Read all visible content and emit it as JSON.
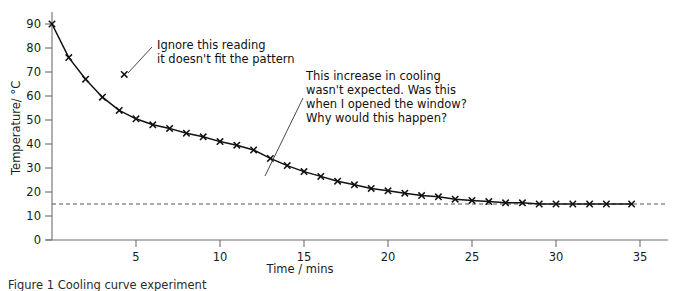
{
  "figure": {
    "caption": "Figure 1  Cooling curve experiment"
  },
  "chart_data": {
    "type": "line",
    "title": "",
    "xlabel": "Time / mins",
    "ylabel": "Temperature/ °C",
    "xlim": [
      0,
      37
    ],
    "ylim": [
      0,
      95
    ],
    "grid": false,
    "legend": "none",
    "x_ticks": [
      5,
      10,
      15,
      20,
      25,
      30,
      35
    ],
    "y_ticks": [
      0,
      10,
      20,
      30,
      40,
      50,
      60,
      70,
      80,
      90
    ],
    "x_tick_labels": [
      "5",
      "10",
      "15",
      "20",
      "25",
      "30",
      "35"
    ],
    "y_tick_labels": [
      "0",
      "10",
      "20",
      "30",
      "40",
      "50",
      "60",
      "70",
      "80",
      "90"
    ],
    "reference_line": {
      "label": "room temperature",
      "orientation": "horizontal",
      "value": 15,
      "style": "dashed"
    },
    "series": [
      {
        "name": "Temperature of cooling liquid",
        "marker": "x",
        "x": [
          0,
          1,
          2,
          3,
          4,
          5,
          6,
          7,
          8,
          9,
          10,
          11,
          12,
          13,
          14,
          15,
          16,
          17,
          18,
          19,
          20,
          21,
          22,
          23,
          24,
          25,
          26,
          27,
          28,
          29,
          30,
          31,
          32,
          33,
          34.5
        ],
        "values": [
          90,
          76,
          67,
          59.5,
          54,
          50.5,
          48,
          46.5,
          44.5,
          43,
          41,
          39.5,
          37.5,
          34,
          31,
          28.5,
          26.5,
          24.5,
          23,
          21.5,
          20.5,
          19.5,
          18.5,
          18,
          17,
          16.5,
          16,
          15.5,
          15.5,
          15,
          15,
          15,
          15,
          15,
          15
        ]
      },
      {
        "name": "Anomalous reading (ignored)",
        "marker": "x",
        "x": [
          4.3
        ],
        "values": [
          69
        ]
      }
    ]
  },
  "annotations": [
    {
      "id": "outlier-note",
      "lines": [
        "Ignore this reading",
        "it doesn't fit the pattern"
      ],
      "text_x": 157,
      "text_y": 49,
      "leader": {
        "x1": 152,
        "y1": 47,
        "x2": 128,
        "y2": 73
      }
    },
    {
      "id": "cooling-increase-note",
      "lines": [
        "This increase in cooling",
        "wasn't expected. Was this",
        "when I opened the window?",
        "Why would this happen?"
      ],
      "text_x": 306,
      "text_y": 80,
      "leader": {
        "x1": 303,
        "y1": 98,
        "x2": 265,
        "y2": 176
      }
    }
  ]
}
